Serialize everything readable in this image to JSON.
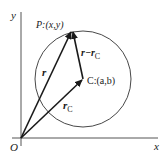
{
  "diagram": {
    "type": "vector-geometry",
    "colors": {
      "line": "#1a1a1a",
      "axis": "#555555",
      "circle": "#333333",
      "background": "#ffffff"
    },
    "axes": {
      "x_label": "x",
      "y_label": "y",
      "origin_label": "O"
    },
    "points": {
      "P": {
        "label": "P",
        "coords": "(x,y)",
        "text": "P:(x,y)"
      },
      "C": {
        "label": "C",
        "coords": "(a,b)",
        "text": "C:(a,b)"
      }
    },
    "vectors": {
      "r": {
        "label": "r",
        "from": "O",
        "to": "P"
      },
      "r_c": {
        "label": "r",
        "subscript": "C",
        "from": "O",
        "to": "C"
      },
      "r_minus_rc": {
        "label": "r−r",
        "subscript": "C",
        "from": "C",
        "to": "P"
      }
    },
    "circle": {
      "centre": "C",
      "passes_through": "P"
    }
  }
}
